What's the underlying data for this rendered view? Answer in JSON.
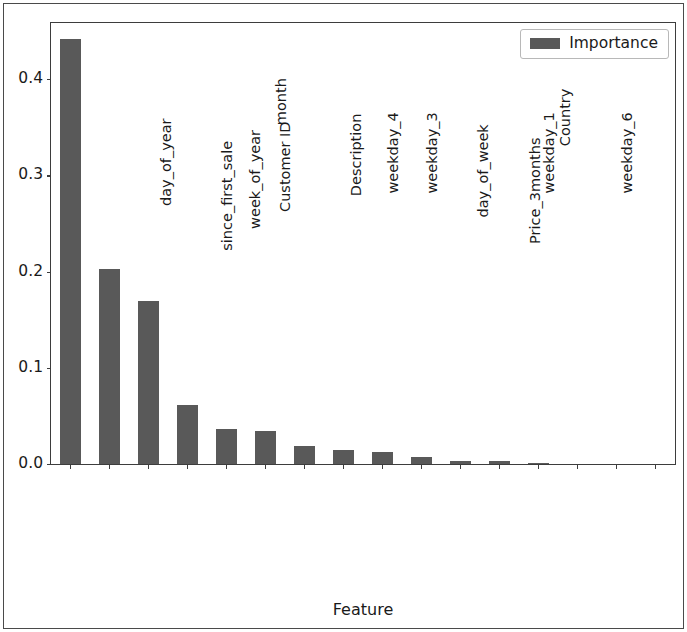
{
  "chart_data": {
    "type": "bar",
    "title": "",
    "xlabel": "Feature",
    "ylabel": "",
    "ylim": [
      0.0,
      0.4583
    ],
    "yticks": [
      "0.0",
      "0.1",
      "0.2",
      "0.3",
      "0.4"
    ],
    "ytick_values": [
      0.0,
      0.1,
      0.2,
      0.3,
      0.4
    ],
    "grid": false,
    "legend_position": "upper right",
    "legend": [
      "Importance"
    ],
    "bar_color": "#595959",
    "categories": [
      "day_of_year",
      "since_first_sale",
      "week_of_year",
      "Customer ID",
      "month",
      "Description",
      "weekday_4",
      "weekday_3",
      "day_of_week",
      "Price_3months",
      "weekday_1",
      "Country",
      "weekday_6",
      "holiday_season",
      "weekday_0",
      "weekday_2"
    ],
    "series": [
      {
        "name": "Importance",
        "values": [
          0.442,
          0.203,
          0.169,
          0.061,
          0.036,
          0.034,
          0.019,
          0.015,
          0.013,
          0.007,
          0.003,
          0.003,
          0.001,
          0.0,
          0.0,
          0.0
        ]
      }
    ]
  },
  "legend": {
    "entry_label": "Importance",
    "swatch_color": "#595959"
  },
  "axis": {
    "x_title": "Feature"
  }
}
